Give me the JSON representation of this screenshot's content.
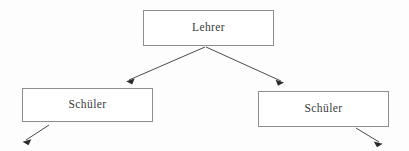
{
  "diagram": {
    "background_color": "#fdfdfd",
    "border_color": "#8d8d8f",
    "text_color": "#3a3a3c",
    "line_color": "#4a4a4c",
    "arrow_fill": "#2b2b2d",
    "nodes": [
      {
        "id": "lehrer",
        "label": "Lehrer",
        "role": "root",
        "x": 143,
        "y": 10,
        "width": 131,
        "height": 36
      },
      {
        "id": "schueler-left",
        "label": "Schüler",
        "role": "child",
        "x": 22,
        "y": 88,
        "width": 131,
        "height": 34
      },
      {
        "id": "schueler-right",
        "label": "Schüler",
        "role": "child",
        "x": 258,
        "y": 91,
        "width": 131,
        "height": 36
      }
    ],
    "edges": [
      {
        "id": "lehrer-to-schueler-left",
        "from": "lehrer",
        "to": "schueler-left",
        "direction": "down-left",
        "arrowhead": true
      },
      {
        "id": "lehrer-to-schueler-right",
        "from": "lehrer",
        "to": "schueler-right",
        "direction": "down-right",
        "arrowhead": true
      },
      {
        "id": "schueler-left-descendant",
        "from": "schueler-left",
        "to": "",
        "direction": "down-left",
        "arrowhead": true
      },
      {
        "id": "schueler-right-descendant",
        "from": "schueler-right",
        "to": "",
        "direction": "down-right",
        "arrowhead": true
      }
    ]
  }
}
